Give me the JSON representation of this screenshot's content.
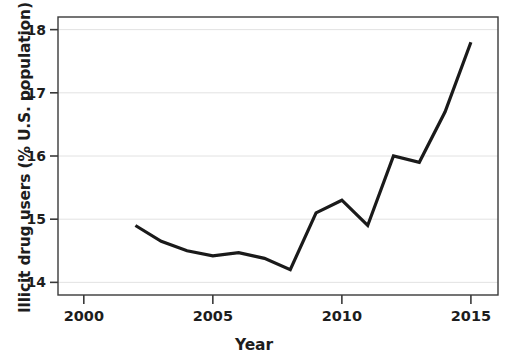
{
  "chart_data": {
    "type": "line",
    "title": "",
    "xlabel": "Year",
    "ylabel": "Illicit drug users (% U.S. population)",
    "x": [
      2002,
      2003,
      2004,
      2005,
      2006,
      2007,
      2008,
      2009,
      2010,
      2011,
      2012,
      2013,
      2014,
      2015
    ],
    "values": [
      14.9,
      14.65,
      14.5,
      14.42,
      14.47,
      14.38,
      14.2,
      15.1,
      15.3,
      14.9,
      16.0,
      15.9,
      16.7,
      17.8
    ],
    "series": [
      {
        "name": "Illicit drug users",
        "values": [
          14.9,
          14.65,
          14.5,
          14.42,
          14.47,
          14.38,
          14.2,
          15.1,
          15.3,
          14.9,
          16.0,
          15.9,
          16.7,
          17.8
        ]
      }
    ],
    "xlim": [
      1999.0,
      2016.05
    ],
    "ylim": [
      13.8,
      18.2
    ],
    "xticks": [
      2000,
      2005,
      2010,
      2015
    ],
    "xtick_labels": [
      "2000",
      "2005",
      "2010",
      "2015"
    ],
    "yticks": [
      14,
      15,
      16,
      17,
      18
    ],
    "ytick_labels": [
      "14",
      "15",
      "16",
      "17",
      "18"
    ],
    "grid": "horizontal",
    "legend": "none",
    "line_color": "#1a1a1a",
    "line_width": 3.2,
    "grid_color": "#e2e2e2",
    "axis_color": "#3a3a3a",
    "background_color": "#ffffff"
  }
}
